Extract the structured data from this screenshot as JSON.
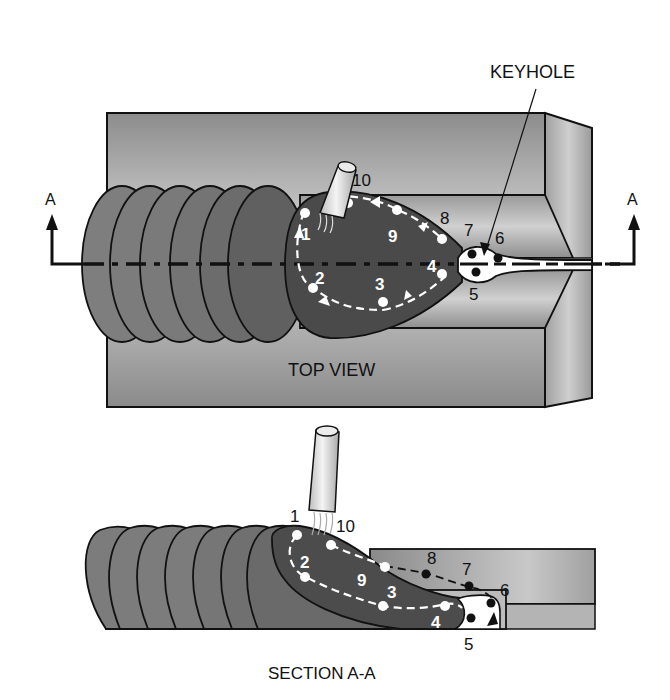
{
  "top_view": {
    "title": "TOP VIEW",
    "keyhole_label": "KEYHOLE",
    "section_marker_left": "A",
    "section_marker_right": "A",
    "path_points": [
      "1",
      "2",
      "3",
      "4",
      "5",
      "6",
      "7",
      "8",
      "9",
      "10"
    ]
  },
  "section_view": {
    "title": "SECTION A-A",
    "path_points": [
      "1",
      "2",
      "3",
      "4",
      "5",
      "6",
      "7",
      "8",
      "9",
      "10"
    ]
  },
  "colors": {
    "plate": "#a9a9a9",
    "bead": "#7a7a7a",
    "pool": "#4a4a4a",
    "outline": "#111111",
    "keyhole": "#ffffff"
  }
}
